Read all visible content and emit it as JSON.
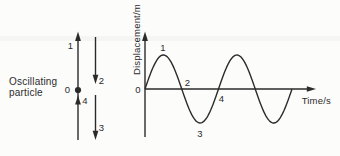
{
  "colors": {
    "ink": "#2b2b2b",
    "background": "#fcfcfb"
  },
  "figure": {
    "caption": {
      "line1": "Oscillating",
      "line2": "particle"
    },
    "particle_diagram": {
      "equilibrium_label": "0",
      "stage_labels": {
        "stage1": "1",
        "stage2": "2",
        "stage3": "3",
        "stage4": "4"
      }
    }
  },
  "chart_data": {
    "type": "line",
    "waveform": "sine",
    "title": "",
    "xlabel": "Time/s",
    "ylabel": "Displacement/m",
    "origin_label": "0",
    "grid": false,
    "cycles": 2,
    "starts_at": "origin, rising",
    "point_labels": [
      {
        "label": "1",
        "at": "first-peak"
      },
      {
        "label": "2",
        "at": "first-descending-zero-crossing"
      },
      {
        "label": "3",
        "at": "first-trough"
      },
      {
        "label": "4",
        "at": "second-ascending-zero-crossing"
      }
    ],
    "geometry": {
      "origin_x": 145,
      "origin_y": 89,
      "amplitude_px": 34,
      "period_px": 73.5,
      "axis_x_end": 311,
      "axis_y_top": 37,
      "axis_y_bottom": 137
    }
  }
}
